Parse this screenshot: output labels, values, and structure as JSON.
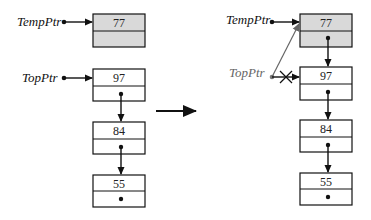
{
  "diagram": {
    "type": "linked-list-push",
    "before": {
      "pointers": [
        {
          "name": "TempPtr",
          "points_to": "77"
        },
        {
          "name": "TopPtr",
          "points_to": "97"
        }
      ],
      "new_node": {
        "value": "77",
        "shaded": true
      },
      "list": [
        {
          "value": "97"
        },
        {
          "value": "84"
        },
        {
          "value": "55",
          "next": "null"
        }
      ]
    },
    "transition_arrow": "right",
    "after": {
      "pointers": [
        {
          "name": "TempPtr",
          "points_to": "77"
        },
        {
          "name": "TopPtr",
          "points_to": "77",
          "old_link_crossed_out": true
        }
      ],
      "list": [
        {
          "value": "77",
          "shaded": true
        },
        {
          "value": "97"
        },
        {
          "value": "84"
        },
        {
          "value": "55",
          "next": "null"
        }
      ]
    }
  },
  "labels": {
    "temp_ptr": "TempPtr",
    "top_ptr": "TopPtr"
  },
  "left": {
    "n77": "77",
    "n97": "97",
    "n84": "84",
    "n55": "55"
  },
  "right": {
    "n77": "77",
    "n97": "97",
    "n84": "84",
    "n55": "55"
  },
  "colors": {
    "shaded_node": "#d9d9d9",
    "line": "#111111",
    "gray_pointer": "#777777"
  }
}
